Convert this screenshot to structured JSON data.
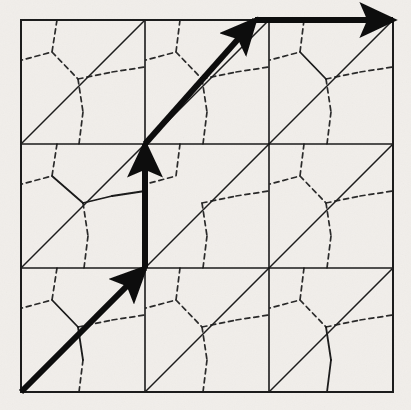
{
  "figure": {
    "type": "geometric-lattice-diagram",
    "background_color": "#f1eeea",
    "ink_color": "#1a1a1a",
    "canvas": {
      "width": 411,
      "height": 410
    },
    "frame": {
      "x0": 21,
      "y0": 20,
      "x1": 393,
      "y1": 392,
      "stroke_width": 2.0
    },
    "grid": {
      "columns_x": [
        21,
        145,
        269,
        393
      ],
      "rows_y": [
        20,
        144,
        268,
        392
      ],
      "cell_size": 124,
      "stroke_width": 1.6,
      "description": "3 by 3 square grid"
    },
    "diagonals": {
      "direction": "bottom-left to top-right",
      "stroke_width": 1.5,
      "description": "One diagonal per grid cell forming a triangular lattice",
      "cells": [
        {
          "x0": 21,
          "y0": 144,
          "x1": 145,
          "y1": 20
        },
        {
          "x0": 145,
          "y0": 144,
          "x1": 269,
          "y1": 20
        },
        {
          "x0": 269,
          "y0": 144,
          "x1": 393,
          "y1": 20
        },
        {
          "x0": 21,
          "y0": 268,
          "x1": 145,
          "y1": 144
        },
        {
          "x0": 145,
          "y0": 268,
          "x1": 269,
          "y1": 144
        },
        {
          "x0": 269,
          "y0": 268,
          "x1": 393,
          "y1": 144
        },
        {
          "x0": 21,
          "y0": 392,
          "x1": 145,
          "y1": 268
        },
        {
          "x0": 145,
          "y0": 392,
          "x1": 269,
          "y1": 268
        },
        {
          "x0": 269,
          "y0": 392,
          "x1": 393,
          "y1": 268
        }
      ]
    },
    "honeycomb": {
      "style": "dashed",
      "dash_pattern": "5,4",
      "stroke_width": 1.7,
      "description": "Dual honeycomb lattice drawn with dashed lines, one hexagon centre per triangle"
    },
    "solid_honeycomb_segments": {
      "style": "solid",
      "stroke_width": 1.8,
      "count": 6,
      "description": "A few honeycomb edges rendered solid instead of dashed"
    },
    "bold_arrows": [
      {
        "name": "lower-left-diagonal-arrow",
        "from": {
          "x": 21,
          "y": 392
        },
        "to": {
          "x": 145,
          "y": 268
        },
        "direction": "up-right 45 degrees",
        "stroke_width": 6,
        "arrowhead_at": {
          "x": 117,
          "y": 296
        }
      },
      {
        "name": "vertical-arrow",
        "from": {
          "x": 145,
          "y": 268
        },
        "to": {
          "x": 145,
          "y": 144
        },
        "direction": "up",
        "stroke_width": 6,
        "arrowhead_at": {
          "x": 145,
          "y": 172
        }
      },
      {
        "name": "upper-diagonal-arrow",
        "from": {
          "x": 145,
          "y": 144
        },
        "to": {
          "x": 255,
          "y": 20
        },
        "direction": "up-right 45 degrees",
        "stroke_width": 6,
        "arrowhead_at": {
          "x": 233,
          "y": 47
        }
      },
      {
        "name": "top-horizontal-arrow",
        "from": {
          "x": 255,
          "y": 20
        },
        "to": {
          "x": 393,
          "y": 20
        },
        "direction": "right",
        "stroke_width": 6,
        "arrowhead_at": {
          "x": 368,
          "y": 20
        }
      }
    ]
  }
}
